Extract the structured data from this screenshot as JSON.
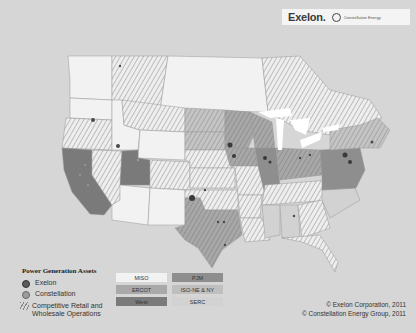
{
  "header": {
    "exelon_logo": "Exelon.",
    "constellation_logo": "Constellation Energy"
  },
  "map": {
    "title": "US Power Generation Assets Map",
    "colors": {
      "background": "#d6d6d6",
      "land_plain": "#f0f0f0",
      "MISO": "#f2f2f2",
      "PJM": "#8e8e8e",
      "ERCOT": "#a9a9a9",
      "ISO-NE & NY": "#bfbfbf",
      "West": "#7a7a7a",
      "SERC": "#d2d2d2",
      "hatch": "#888888",
      "exelon_dot": "#4a4a4a",
      "constellation_dot": "#9a9a9a"
    }
  },
  "legend": {
    "title": "Power Generation Assets",
    "items": [
      {
        "label": "Exelon",
        "type": "dot-dark"
      },
      {
        "label": "Constellation",
        "type": "dot-light"
      },
      {
        "label_line1": "Competitive Retail and",
        "label_line2": "Wholesale Operations",
        "type": "hatch"
      }
    ],
    "regions": [
      {
        "label": "MISO",
        "color": "#f2f2f2"
      },
      {
        "label": "PJM",
        "color": "#8e8e8e"
      },
      {
        "label": "ERCOT",
        "color": "#a9a9a9"
      },
      {
        "label": "ISO-NE & NY",
        "color": "#bfbfbf"
      },
      {
        "label": "West",
        "color": "#7a7a7a"
      },
      {
        "label": "SERC",
        "color": "#d2d2d2"
      }
    ]
  },
  "footer": {
    "copyright_1": "© Exelon Corporation, 2011",
    "copyright_2": "© Constellation Energy Group, 2011"
  }
}
